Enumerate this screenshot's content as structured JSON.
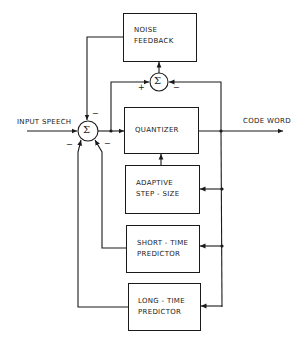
{
  "diagram": {
    "blocks": {
      "noise_feedback": {
        "line1": "NOISE",
        "line2": "FEEDBACK"
      },
      "quantizer": {
        "line1": "QUANTIZER"
      },
      "adaptive": {
        "line1": "ADAPTIVE",
        "line2": "STEP - SIZE"
      },
      "short_time": {
        "line1": "SHORT - TIME",
        "line2": "PREDICTOR"
      },
      "long_time": {
        "line1": "LONG - TIME",
        "line2": "PREDICTOR"
      }
    },
    "labels": {
      "input": "INPUT SPEECH",
      "output": "CODE WORD"
    },
    "summers": {
      "symbol": "Σ",
      "sum1_signs": {
        "top": "−",
        "left": "−",
        "right": "−"
      },
      "sum2_signs": {
        "left": "+",
        "right": "−"
      }
    }
  }
}
